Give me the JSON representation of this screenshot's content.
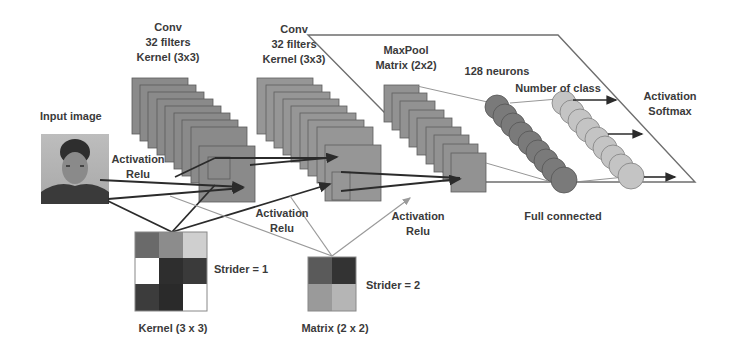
{
  "diagram": {
    "input": {
      "label": "Input image",
      "image_desc": "face-photo"
    },
    "conv1": {
      "lines": [
        "Conv",
        "32 filters",
        "Kernel (3x3)"
      ],
      "activation": [
        "Activation",
        "Relu"
      ]
    },
    "conv2": {
      "lines": [
        "Conv",
        "32 filters",
        "Kernel (3x3)"
      ],
      "activation": [
        "Activation",
        "Relu"
      ]
    },
    "maxpool": {
      "lines": [
        "MaxPool",
        "Matrix (2x2)"
      ],
      "activation": [
        "Activation",
        "Relu"
      ]
    },
    "dense": {
      "label": "128 neurons"
    },
    "output": {
      "label": "Number of class",
      "activation": [
        "Activation",
        "Softmax"
      ]
    },
    "fc_label": "Full connected",
    "kernel": {
      "label": "Kernel (3 x 3)",
      "strider": "Strider = 1",
      "cells": [
        "#6a6a6a",
        "#8c8c8c",
        "#cfcfcf",
        "#ffffff",
        "#2e2e2e",
        "#3a3a3a",
        "#3c3c3c",
        "#2a2a2a",
        "#ffffff"
      ]
    },
    "pool_matrix": {
      "label": "Matrix (2 x 2)",
      "strider": "Strider = 2",
      "cells": [
        "#5a5a5a",
        "#333333",
        "#9a9a9a",
        "#b5b5b5"
      ]
    },
    "colors": {
      "feature_map": "#8a8a8a",
      "feature_edge": "#5a5a5a",
      "neuron_dark": "#7a7a7a",
      "neuron_light": "#c4c4c4",
      "line_dark": "#2b2b2b",
      "line_light": "#9a9a9a",
      "text": "#3a3a3a"
    }
  }
}
